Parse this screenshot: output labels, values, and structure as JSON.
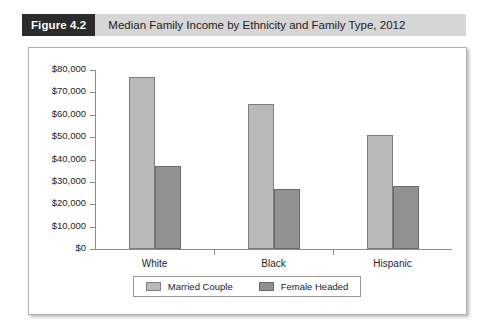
{
  "figure": {
    "number_label": "Figure 4.2",
    "title": "Median Family Income by Ethnicity and Family Type, 2012"
  },
  "colors": {
    "title_bar_background": "#d6d6d6",
    "title_badge_background": "#2b2b2b",
    "title_badge_text": "#ffffff",
    "panel_background": "#ffffff",
    "panel_border": "#b0b0b0",
    "axis_line": "#8d8d8d",
    "series_married_fill": "#b9b9b9",
    "series_married_border": "#7d7d7d",
    "series_female_fill": "#919191",
    "series_female_border": "#6a6a6a",
    "text": "#1d1d1d"
  },
  "chart_data": {
    "type": "bar",
    "title": "Median Family Income by Ethnicity and Family Type, 2012",
    "xlabel": "",
    "ylabel": "",
    "categories": [
      "White",
      "Black",
      "Hispanic"
    ],
    "series": [
      {
        "name": "Married Couple",
        "values": [
          77000,
          65000,
          51000
        ]
      },
      {
        "name": "Female Headed",
        "values": [
          37000,
          27000,
          28000
        ]
      }
    ],
    "ylim": [
      0,
      80000
    ],
    "ytick_values": [
      0,
      10000,
      20000,
      30000,
      40000,
      50000,
      60000,
      70000,
      80000
    ],
    "ytick_labels": [
      "$0",
      "$10,000",
      "$20,000",
      "$30,000",
      "$40,000",
      "$50,000",
      "$60,000",
      "$70,000",
      "$80,000"
    ],
    "grid": false,
    "legend_position": "bottom",
    "legend_entries": [
      "Married Couple",
      "Female Headed"
    ]
  }
}
